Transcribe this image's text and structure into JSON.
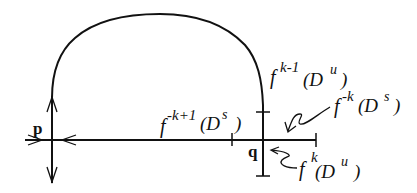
{
  "diagram": {
    "type": "homoclinic-orbit-diagram",
    "points": {
      "p": "p",
      "q": "q"
    },
    "labels": {
      "fk1_Du": {
        "f": "f",
        "sup": "k-1",
        "paren_open": "(D",
        "sup2": "u",
        "paren_close": ")"
      },
      "fmk_Ds": {
        "f": "f",
        "sup": "-k",
        "paren_open": "(D",
        "sup2": "s",
        "paren_close": ")"
      },
      "fmk1_Ds": {
        "f": "f",
        "sup": "-k+1",
        "paren_open": "(D",
        "sup2": "s",
        "paren_close": ")"
      },
      "fk_Du": {
        "f": "f",
        "sup": "k",
        "paren_open": "(D",
        "sup2": "u",
        "paren_close": ")"
      }
    },
    "colors": {
      "stroke": "#111111",
      "background": "#ffffff"
    }
  }
}
